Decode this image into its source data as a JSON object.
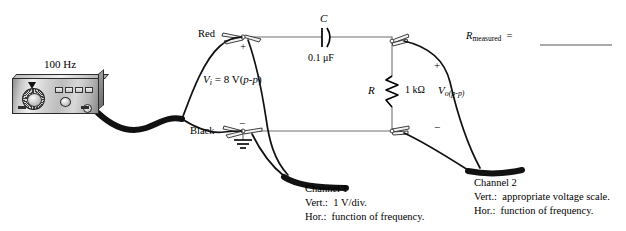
{
  "figure": {
    "type": "circuit-diagram"
  },
  "source": {
    "frequency_label": "100 Hz",
    "device_name": "function-generator",
    "terminals": {
      "red_label": "Red",
      "black_label": "Black",
      "red_polarity": "+",
      "black_polarity": "−"
    },
    "input_voltage": {
      "symbol": "V",
      "subscript": "i",
      "equals": "=",
      "value": "8 V(",
      "pp": "p-p",
      "close": ")"
    }
  },
  "components": {
    "capacitor": {
      "designator": "C",
      "value": "0.1 μF"
    },
    "resistor": {
      "designator": "R",
      "value": "1 kΩ"
    }
  },
  "output": {
    "symbol": "V",
    "subscript": "o(p-p)",
    "plus": "+",
    "minus": "−"
  },
  "measurement": {
    "symbol": "R",
    "subscript": "measured",
    "equals": "=",
    "blank": ""
  },
  "channels": [
    {
      "name": "Channel 1",
      "vert_key": "Vert.:",
      "vert_value": "1 V/div.",
      "hor_key": "Hor.:",
      "hor_value": "function of frequency."
    },
    {
      "name": "Channel 2",
      "vert_key": "Vert.:",
      "vert_value": "appropriate voltage scale.",
      "hor_key": "Hor.:",
      "hor_value": "function of frequency."
    }
  ],
  "colors": {
    "ink": "#000000",
    "wire": "#6f6f6f",
    "cable": "#111111",
    "background": "#ffffff"
  }
}
